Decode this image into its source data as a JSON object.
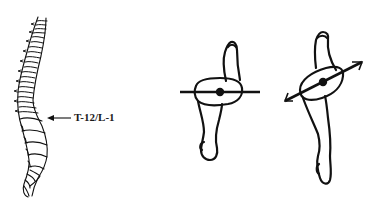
{
  "figure": {
    "panels": [
      {
        "id": "spine",
        "description": "Lateral view of vertebral column",
        "annotation": {
          "text": "T-12/L-1",
          "arrow_direction": "left"
        }
      },
      {
        "id": "pelvis-neutral",
        "description": "Pelvis/leg top view with horizontal axis bar"
      },
      {
        "id": "pelvis-rotated",
        "description": "Pelvis/leg top view with rotated axis bar and arrowheads"
      }
    ],
    "colors": {
      "ink": "#111111",
      "background": "#ffffff"
    }
  }
}
